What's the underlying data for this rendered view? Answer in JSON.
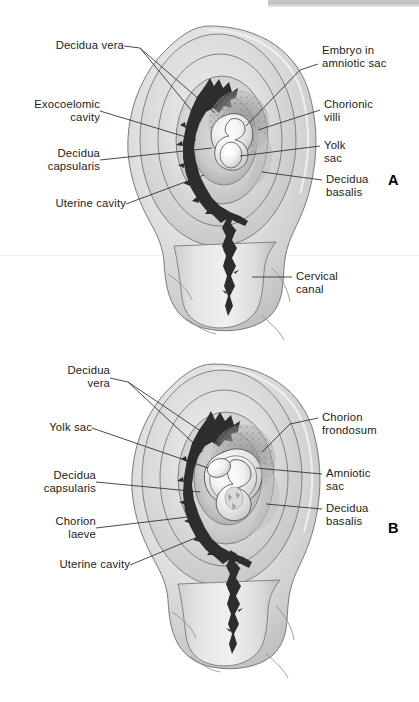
{
  "figure": {
    "panels": [
      {
        "letter": "A",
        "labels_left": [
          {
            "text": "Decidua vera",
            "align": "right"
          },
          {
            "text": "Exocoelomic\ncavity",
            "align": "right"
          },
          {
            "text": "Decidua\ncapsularis",
            "align": "right"
          },
          {
            "text": "Uterine cavity",
            "align": "right"
          }
        ],
        "labels_right": [
          {
            "text": "Embryo in\namniotic sac",
            "align": "left"
          },
          {
            "text": "Chorionic\nvilli",
            "align": "left"
          },
          {
            "text": "Yolk\nsac",
            "align": "left"
          },
          {
            "text": "Decidua\nbasalis",
            "align": "left"
          },
          {
            "text": "Cervical\ncanal",
            "align": "left"
          }
        ]
      },
      {
        "letter": "B",
        "labels_left": [
          {
            "text": "Decidua\nvera",
            "align": "right"
          },
          {
            "text": "Yolk sac",
            "align": "right"
          },
          {
            "text": "Decidua\ncapsularis",
            "align": "right"
          },
          {
            "text": "Chorion\nlaeve",
            "align": "right"
          },
          {
            "text": "Uterine cavity",
            "align": "right"
          }
        ],
        "labels_right": [
          {
            "text": "Chorion\nfrondosum",
            "align": "left"
          },
          {
            "text": "Amniotic\nsac",
            "align": "left"
          },
          {
            "text": "Decidua\nbasalis",
            "align": "left"
          }
        ]
      }
    ]
  },
  "labels": {
    "a_decidua_vera": "Decidua vera",
    "a_exocoelomic_cavity": "Exocoelomic\ncavity",
    "a_decidua_capsularis": "Decidua\ncapsularis",
    "a_uterine_cavity": "Uterine cavity",
    "a_embryo_amniotic_sac": "Embryo in\namniotic sac",
    "a_chorionic_villi": "Chorionic\nvilli",
    "a_yolk_sac": "Yolk\nsac",
    "a_decidua_basalis": "Decidua\nbasalis",
    "a_cervical_canal": "Cervical\ncanal",
    "a_panel_letter": "A",
    "b_decidua_vera": "Decidua\nvera",
    "b_yolk_sac": "Yolk sac",
    "b_decidua_capsularis": "Decidua\ncapsularis",
    "b_chorion_laeve": "Chorion\nlaeve",
    "b_uterine_cavity": "Uterine cavity",
    "b_chorion_frondosum": "Chorion\nfrondosum",
    "b_amniotic_sac": "Amniotic\nsac",
    "b_decidua_basalis": "Decidua\nbasalis",
    "b_panel_letter": "B"
  },
  "colors": {
    "background": "#ffffff",
    "text": "#1c1c1c",
    "leader_line": "#2b2b2b",
    "outline": "#555555",
    "tissue_light": "#ededed",
    "tissue_mid": "#d2d2d2",
    "tissue_dark": "#b4b4b4",
    "decidua_dark_band": "#2e2e2e",
    "villi_stipple": "#8f8f8f",
    "embryo_highlight": "#fbfbfb",
    "header_band": "#c3c3c3"
  }
}
